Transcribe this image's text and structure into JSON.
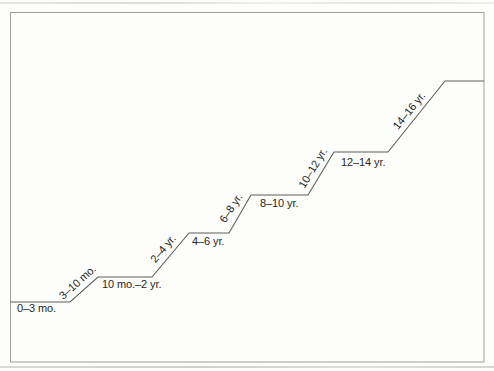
{
  "diagram": {
    "type": "staircase",
    "stages": [
      {
        "label": "0–3 mo.",
        "orientation": "horizontal"
      },
      {
        "label": "3–10 mo.",
        "orientation": "diagonal"
      },
      {
        "label": "10 mo.–2 yr.",
        "orientation": "horizontal"
      },
      {
        "label": "2–4 yr.",
        "orientation": "diagonal"
      },
      {
        "label": "4–6 yr.",
        "orientation": "horizontal"
      },
      {
        "label": "6–8 yr.",
        "orientation": "diagonal"
      },
      {
        "label": "8–10 yr.",
        "orientation": "horizontal"
      },
      {
        "label": "10–12 yr.",
        "orientation": "diagonal"
      },
      {
        "label": "12–14 yr.",
        "orientation": "horizontal"
      },
      {
        "label": "14–16 yr.",
        "orientation": "diagonal"
      }
    ],
    "colors": {
      "line": "#5f5f5f",
      "border": "#9e9e9e",
      "text": "#262626",
      "background": "#fdfdfb"
    }
  }
}
